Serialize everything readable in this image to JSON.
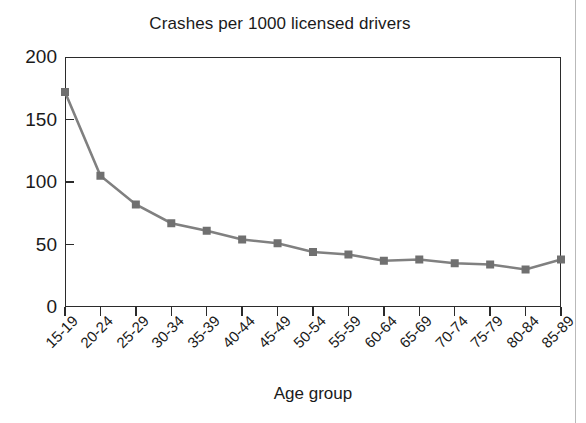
{
  "figure": {
    "background_color": "#ffffff",
    "frame_color": "#2b2b2b",
    "text_color": "#1a1a1a",
    "series_color": "#808080",
    "marker_color": "#707070"
  },
  "chart_data": {
    "type": "line",
    "title": "Crashes per 1000 licensed drivers",
    "xlabel": "Age group",
    "ylabel": "",
    "categories": [
      "15-19",
      "20-24",
      "25-29",
      "30-34",
      "35-39",
      "40-44",
      "45-49",
      "50-54",
      "55-59",
      "60-64",
      "65-69",
      "70-74",
      "75-79",
      "80-84",
      "85-89"
    ],
    "values": [
      172,
      105,
      82,
      67,
      61,
      54,
      51,
      44,
      42,
      37,
      38,
      35,
      34,
      30,
      38
    ],
    "series": [
      {
        "name": "Crashes per 1000 licensed drivers",
        "values": [
          172,
          105,
          82,
          67,
          61,
          54,
          51,
          44,
          42,
          37,
          38,
          35,
          34,
          30,
          38
        ],
        "color": "#808080",
        "marker": "square"
      }
    ],
    "ylim": [
      0,
      200
    ],
    "yticks": [
      0,
      50,
      100,
      150,
      200
    ],
    "ytick_labels": [
      "0",
      "50",
      "100",
      "150",
      "200"
    ],
    "grid": false,
    "legend": false,
    "legend_position": "none",
    "xtick_rotation": -45
  }
}
